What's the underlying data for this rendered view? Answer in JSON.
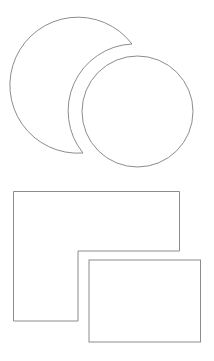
{
  "canvas": {
    "width": 214,
    "height": 361,
    "background": "#ffffff"
  },
  "style": {
    "stroke": "#8c8c8c",
    "stroke_width": 1,
    "fill": "#ffffff"
  },
  "shapes": {
    "crescent": {
      "outer_center": [
        80,
        85
      ],
      "outer_r": 68,
      "inner_center": [
        137.5,
        111.5
      ],
      "inner_r": 67,
      "tip_top": [
        132,
        44
      ],
      "tip_bottom": [
        83,
        153
      ]
    },
    "circle": {
      "cx": 137.5,
      "cy": 111.5,
      "r": 55.5
    },
    "l_shape": {
      "points": [
        [
          13.5,
          191.5
        ],
        [
          179.5,
          191.5
        ],
        [
          179.5,
          251
        ],
        [
          78,
          251
        ],
        [
          78,
          321
        ],
        [
          13.5,
          321
        ]
      ]
    },
    "rectangle": {
      "x": 89,
      "y": 260,
      "width": 111.5,
      "height": 82
    }
  }
}
